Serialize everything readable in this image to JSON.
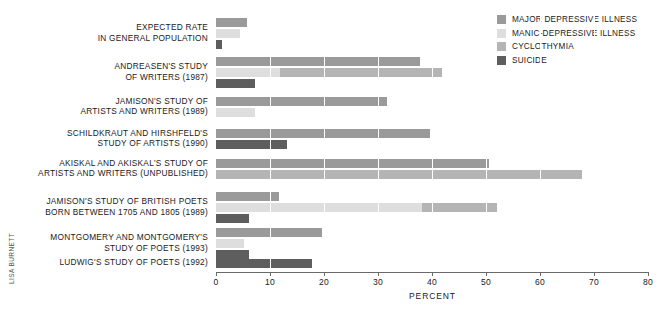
{
  "credit": "LISA BURNETT",
  "legend": {
    "items": [
      {
        "label": "MAJOR DEPRESSIVE ILLNESS",
        "color": "#9a9a9a"
      },
      {
        "label": "MANIC-DEPRESSIVE ILLNESS",
        "color": "#dedede"
      },
      {
        "label": "CYCLOTHYMIA",
        "color": "#b4b4b4"
      },
      {
        "label": "SUICIDE",
        "color": "#5e5e5e"
      }
    ]
  },
  "chart_data": {
    "type": "bar",
    "orientation": "horizontal",
    "title": "",
    "xlabel": "PERCENT",
    "ylabel": "",
    "xlim": [
      0,
      80
    ],
    "xticks": [
      0,
      10,
      20,
      30,
      40,
      50,
      60,
      70,
      80
    ],
    "xtick_labels": [
      "0",
      "10",
      "20",
      "30",
      "40",
      "50",
      "60",
      "70",
      "80"
    ],
    "grid": true,
    "grid_axis": "x",
    "legend_position": "top-right",
    "series": [
      {
        "name": "MAJOR DEPRESSIVE ILLNESS",
        "color": "#9a9a9a"
      },
      {
        "name": "MANIC-DEPRESSIVE ILLNESS",
        "color": "#dedede"
      },
      {
        "name": "CYCLOTHYMIA",
        "color": "#b4b4b4"
      },
      {
        "name": "SUICIDE",
        "color": "#5e5e5e"
      }
    ],
    "categories": [
      "EXPECTED RATE\nIN GENERAL POPULATION",
      "ANDREASEN'S STUDY\nOF WRITERS (1987)",
      "JAMISON'S STUDY OF\nARTISTS AND WRITERS (1989)",
      "SCHILDKRAUT AND HIRSHFELD'S\nSTUDY OF ARTISTS (1990)",
      "AKISKAL AND AKISKAL'S STUDY OF\nARTISTS AND WRITERS (UNPUBLISHED)",
      "JAMISON'S STUDY OF BRITISH POETS\nBORN BETWEEN 1705 AND 1805 (1989)",
      "MONTGOMERY AND MONTGOMERY'S\nSTUDY OF POETS (1993)",
      "LUDWIG'S STUDY OF POETS (1992)"
    ],
    "groups": [
      {
        "category": "EXPECTED RATE\nIN GENERAL POPULATION",
        "bars": [
          {
            "segments": [
              {
                "series": "MAJOR DEPRESSIVE ILLNESS",
                "start": 0,
                "value": 5.7
              }
            ]
          },
          {
            "segments": [
              {
                "series": "MANIC-DEPRESSIVE ILLNESS",
                "start": 0,
                "value": 4.4
              }
            ]
          },
          {
            "segments": [
              {
                "series": "SUICIDE",
                "start": 0,
                "value": 1.1
              }
            ]
          }
        ]
      },
      {
        "category": "ANDREASEN'S STUDY\nOF WRITERS (1987)",
        "bars": [
          {
            "segments": [
              {
                "series": "MAJOR DEPRESSIVE ILLNESS",
                "start": 0,
                "value": 37.8
              }
            ]
          },
          {
            "segments": [
              {
                "series": "MANIC-DEPRESSIVE ILLNESS",
                "start": 0,
                "value": 11.8
              },
              {
                "series": "CYCLOTHYMIA",
                "start": 11.8,
                "value": 30.1
              }
            ]
          },
          {
            "segments": [
              {
                "series": "SUICIDE",
                "start": 0,
                "value": 7.2
              }
            ]
          }
        ]
      },
      {
        "category": "JAMISON'S STUDY OF\nARTISTS AND WRITERS (1989)",
        "bars": [
          {
            "segments": [
              {
                "series": "MAJOR DEPRESSIVE ILLNESS",
                "start": 0,
                "value": 31.7
              }
            ]
          },
          {
            "segments": [
              {
                "series": "MANIC-DEPRESSIVE ILLNESS",
                "start": 0,
                "value": 7.2
              }
            ]
          }
        ]
      },
      {
        "category": "SCHILDKRAUT AND HIRSHFELD'S\nSTUDY OF ARTISTS (1990)",
        "bars": [
          {
            "segments": [
              {
                "series": "MAJOR DEPRESSIVE ILLNESS",
                "start": 0,
                "value": 39.6
              }
            ]
          },
          {
            "segments": [
              {
                "series": "SUICIDE",
                "start": 0,
                "value": 13.1
              }
            ]
          }
        ]
      },
      {
        "category": "AKISKAL AND AKISKAL'S STUDY OF\nARTISTS AND WRITERS (UNPUBLISHED)",
        "bars": [
          {
            "segments": [
              {
                "series": "MAJOR DEPRESSIVE ILLNESS",
                "start": 0,
                "value": 50.6
              }
            ]
          },
          {
            "segments": [
              {
                "series": "CYCLOTHYMIA",
                "start": 0,
                "value": 67.8
              }
            ]
          }
        ]
      },
      {
        "category": "JAMISON'S STUDY OF BRITISH POETS\nBORN BETWEEN 1705 AND 1805 (1989)",
        "bars": [
          {
            "segments": [
              {
                "series": "MAJOR DEPRESSIVE ILLNESS",
                "start": 0,
                "value": 11.7
              }
            ]
          },
          {
            "segments": [
              {
                "series": "MANIC-DEPRESSIVE ILLNESS",
                "start": 0,
                "value": 38.1
              },
              {
                "series": "CYCLOTHYMIA",
                "start": 38.1,
                "value": 13.9
              }
            ]
          },
          {
            "segments": [
              {
                "series": "SUICIDE",
                "start": 0,
                "value": 6.1
              }
            ]
          }
        ]
      },
      {
        "category": "MONTGOMERY AND MONTGOMERY'S\nSTUDY OF POETS (1993)",
        "bars": [
          {
            "segments": [
              {
                "series": "MAJOR DEPRESSIVE ILLNESS",
                "start": 0,
                "value": 19.6
              }
            ]
          },
          {
            "segments": [
              {
                "series": "MANIC-DEPRESSIVE ILLNESS",
                "start": 0,
                "value": 5.2
              }
            ]
          },
          {
            "segments": [
              {
                "series": "SUICIDE",
                "start": 0,
                "value": 6.1
              }
            ]
          }
        ]
      },
      {
        "category": "LUDWIG'S STUDY OF POETS (1992)",
        "bars": [
          {
            "segments": [
              {
                "series": "SUICIDE",
                "start": 0,
                "value": 17.8
              }
            ]
          }
        ]
      }
    ]
  },
  "layout": {
    "group_tops": [
      18,
      57,
      97,
      129,
      159,
      192,
      228,
      259
    ],
    "bar_pitch": 11
  }
}
